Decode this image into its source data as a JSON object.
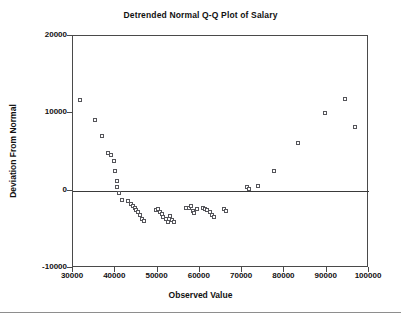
{
  "chart_data": {
    "type": "scatter",
    "title": "Detrended Normal Q-Q Plot of Salary",
    "xlabel": "Observed Value",
    "ylabel": "Deviation From Normal",
    "xlim": [
      30000,
      100000
    ],
    "ylim": [
      -10000,
      20000
    ],
    "xticks": [
      30000,
      40000,
      50000,
      60000,
      70000,
      80000,
      90000,
      100000
    ],
    "xtick_labels": [
      "30000",
      "40000",
      "50000",
      "60000",
      "70000",
      "80000",
      "90000",
      "100000"
    ],
    "yticks": [
      20000,
      10000,
      0,
      -10000
    ],
    "ytick_labels": [
      "20000",
      "10000",
      "0",
      "-10000"
    ],
    "grid": false,
    "legend": null,
    "reference_line": {
      "type": "horizontal",
      "y": 0,
      "color": "#3a3a3a"
    },
    "marker": {
      "shape": "open-square",
      "size": 4,
      "edge_color": "#55555a",
      "fill": "#ffffff"
    },
    "series": [
      {
        "name": "Detrended deviation",
        "points": [
          [
            31600,
            11700
          ],
          [
            35200,
            9200
          ],
          [
            36900,
            7100
          ],
          [
            38300,
            4900
          ],
          [
            38900,
            4600
          ],
          [
            39700,
            3800
          ],
          [
            39900,
            2600
          ],
          [
            40300,
            1200
          ],
          [
            40500,
            500
          ],
          [
            40800,
            -350
          ],
          [
            41500,
            -1200
          ],
          [
            43000,
            -1350
          ],
          [
            43600,
            -1750
          ],
          [
            44100,
            -2000
          ],
          [
            44600,
            -2250
          ],
          [
            45000,
            -2500
          ],
          [
            45400,
            -2750
          ],
          [
            45900,
            -3200
          ],
          [
            46300,
            -3700
          ],
          [
            46700,
            -3900
          ],
          [
            49600,
            -2550
          ],
          [
            50200,
            -2400
          ],
          [
            50500,
            -2700
          ],
          [
            51000,
            -3000
          ],
          [
            51400,
            -3400
          ],
          [
            51900,
            -3700
          ],
          [
            52400,
            -4000
          ],
          [
            53000,
            -3300
          ],
          [
            53400,
            -3800
          ],
          [
            53900,
            -4050
          ],
          [
            56700,
            -2300
          ],
          [
            57400,
            -2200
          ],
          [
            57800,
            -1950
          ],
          [
            58300,
            -2600
          ],
          [
            58700,
            -2950
          ],
          [
            59300,
            -2400
          ],
          [
            60800,
            -2200
          ],
          [
            61300,
            -2400
          ],
          [
            61800,
            -2550
          ],
          [
            62300,
            -2750
          ],
          [
            62900,
            -3150
          ],
          [
            63400,
            -3350
          ],
          [
            65700,
            -2400
          ],
          [
            66300,
            -2600
          ],
          [
            71200,
            450
          ],
          [
            71700,
            250
          ],
          [
            73700,
            600
          ],
          [
            77600,
            2600
          ],
          [
            83300,
            6200
          ],
          [
            89500,
            10100
          ],
          [
            94400,
            11800
          ],
          [
            96600,
            8200
          ]
        ]
      }
    ]
  }
}
